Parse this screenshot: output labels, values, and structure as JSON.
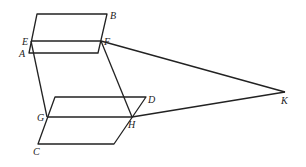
{
  "diagram": {
    "title": "",
    "points": {
      "A": {
        "label": "A",
        "x": 29,
        "y": 53,
        "lx": 19,
        "ly": 57
      },
      "B": {
        "label": "B",
        "x": 107,
        "y": 14,
        "lx": 110,
        "ly": 19
      },
      "C": {
        "label": "C",
        "x": 38,
        "y": 144,
        "lx": 33,
        "ly": 155
      },
      "D": {
        "label": "D",
        "x": 146,
        "y": 97,
        "lx": 148,
        "ly": 103
      },
      "E": {
        "label": "E",
        "x": 31,
        "y": 41,
        "lx": 22,
        "ly": 45
      },
      "F": {
        "label": "F",
        "x": 101,
        "y": 41,
        "lx": 104,
        "ly": 45
      },
      "G": {
        "label": "G",
        "x": 47,
        "y": 117,
        "lx": 37,
        "ly": 121
      },
      "H": {
        "label": "H",
        "x": 132,
        "y": 117,
        "lx": 128,
        "ly": 128
      },
      "K": {
        "label": "K",
        "x": 285,
        "y": 92,
        "lx": 281,
        "ly": 104
      }
    },
    "shapes": [
      {
        "name": "upper-parallelogram",
        "points": "37,14 107,14 98,53 29,53"
      },
      {
        "name": "lower-parallelogram",
        "points": "55,97 146,97 114,144 38,144"
      }
    ],
    "segments": [
      {
        "name": "segment-EF",
        "x1": 31,
        "y1": 41,
        "x2": 101,
        "y2": 41
      },
      {
        "name": "segment-GH",
        "x1": 47,
        "y1": 117,
        "x2": 132,
        "y2": 117
      },
      {
        "name": "segment-EG",
        "x1": 31,
        "y1": 41,
        "x2": 47,
        "y2": 117
      },
      {
        "name": "segment-FH",
        "x1": 101,
        "y1": 41,
        "x2": 132,
        "y2": 117
      },
      {
        "name": "segment-FK",
        "x1": 101,
        "y1": 41,
        "x2": 285,
        "y2": 92
      },
      {
        "name": "segment-HK",
        "x1": 132,
        "y1": 117,
        "x2": 285,
        "y2": 92
      }
    ]
  }
}
